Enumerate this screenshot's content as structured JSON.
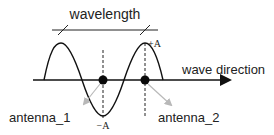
{
  "diagram": {
    "title_label": "wavelength",
    "axis_label": "wave direction",
    "peak_label": "+A",
    "trough_label": "−A",
    "antennas": [
      {
        "id": "antenna_1",
        "label": "antenna_1"
      },
      {
        "id": "antenna_2",
        "label": "antenna_2"
      }
    ],
    "colors": {
      "stroke": "#111111",
      "text": "#222222",
      "pointer_arrow": "#b8b8b8",
      "dot": "#0a0a0a"
    }
  }
}
